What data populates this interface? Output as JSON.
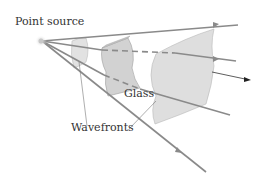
{
  "diagram": {
    "labels": {
      "point_source": "Point source",
      "glass": "Glass",
      "wavefronts": "Wavefronts"
    },
    "colors": {
      "ray": "#8a8a8a",
      "wavefront_fill": "#dcdcdc",
      "glass_fill": "#cfcfcf",
      "text": "#333333",
      "arrow": "#222222"
    },
    "elements": [
      "point-source",
      "rays (4)",
      "small wavefront",
      "glass slab",
      "large wavefront",
      "propagation arrow"
    ]
  }
}
